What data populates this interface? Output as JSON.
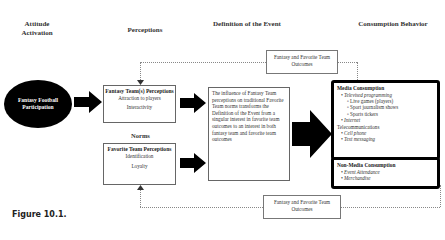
{
  "headers": {
    "attitude": "Attitude Activation",
    "perceptions": "Perceptions",
    "definition": "Definition of the Event",
    "consumption": "Consumption Behavior"
  },
  "attitude_node": {
    "label": "Fantasy Football Participation"
  },
  "fantasy_team_box": {
    "title": "Fantasy Team(s) Perceptions",
    "items": [
      "Attraction to players",
      "Interactivity"
    ]
  },
  "norms_label": "Norms",
  "favorite_team_box": {
    "title": "Favorite Team Perceptions",
    "items": [
      "Identification",
      "Loyalty"
    ]
  },
  "definition_box": {
    "text": "The influence of Fantasy Team perceptions on traditional Favorite Team norms transforms the Definition of the Event from a singular interest in favorite team outcomes to an interest in both fantasy team and favorite team outcomes"
  },
  "outcomes_top": "Fantasy and Favorite Team Outcomes",
  "outcomes_bottom": "Fantasy and Favorite Team Outcomes",
  "media_consumption": {
    "title": "Media Consumption",
    "items": [
      {
        "level": 1,
        "bullet": "•",
        "text": "Televised programming"
      },
      {
        "level": 2,
        "bullet": "▫",
        "text": "Live games (players)"
      },
      {
        "level": 2,
        "bullet": "▫",
        "text": "Sport journalism shows"
      },
      {
        "level": 2,
        "bullet": "▫",
        "text": "Sports tickers"
      },
      {
        "level": 1,
        "bullet": "•",
        "text": "Internet"
      },
      {
        "level": 0,
        "bullet": "",
        "text": "Telecommunications"
      },
      {
        "level": 1,
        "bullet": "•",
        "text": "Cell phone"
      },
      {
        "level": 1,
        "bullet": "•",
        "text": "Text messaging"
      }
    ]
  },
  "non_media_consumption": {
    "title": "Non-Media Consumption",
    "items": [
      {
        "bullet": "•",
        "text": "Event Attendance"
      },
      {
        "bullet": "•",
        "text": "Merchandise"
      }
    ]
  },
  "figure_caption": "Figure 10.1."
}
